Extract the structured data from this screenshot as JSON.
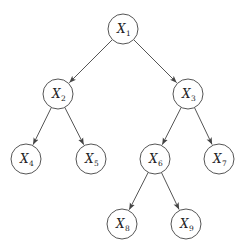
{
  "diagram": {
    "type": "binary-tree",
    "colors": {
      "stroke": "#555555",
      "text": "#222222",
      "background": "#ffffff"
    },
    "nodes": [
      {
        "id": "X1",
        "base": "X",
        "sub": "1",
        "x": 123,
        "y": 29
      },
      {
        "id": "X2",
        "base": "X",
        "sub": "2",
        "x": 58,
        "y": 94
      },
      {
        "id": "X3",
        "base": "X",
        "sub": "3",
        "x": 188,
        "y": 94
      },
      {
        "id": "X4",
        "base": "X",
        "sub": "4",
        "x": 26,
        "y": 159
      },
      {
        "id": "X5",
        "base": "X",
        "sub": "5",
        "x": 91,
        "y": 159
      },
      {
        "id": "X6",
        "base": "X",
        "sub": "6",
        "x": 155,
        "y": 159
      },
      {
        "id": "X7",
        "base": "X",
        "sub": "7",
        "x": 219,
        "y": 159
      },
      {
        "id": "X8",
        "base": "X",
        "sub": "8",
        "x": 122,
        "y": 224
      },
      {
        "id": "X9",
        "base": "X",
        "sub": "9",
        "x": 186,
        "y": 224
      }
    ],
    "edges": [
      {
        "from": "X1",
        "to": "X2"
      },
      {
        "from": "X1",
        "to": "X3"
      },
      {
        "from": "X2",
        "to": "X4"
      },
      {
        "from": "X2",
        "to": "X5"
      },
      {
        "from": "X3",
        "to": "X6"
      },
      {
        "from": "X3",
        "to": "X7"
      },
      {
        "from": "X6",
        "to": "X8"
      },
      {
        "from": "X6",
        "to": "X9"
      }
    ],
    "node_radius": 15
  }
}
